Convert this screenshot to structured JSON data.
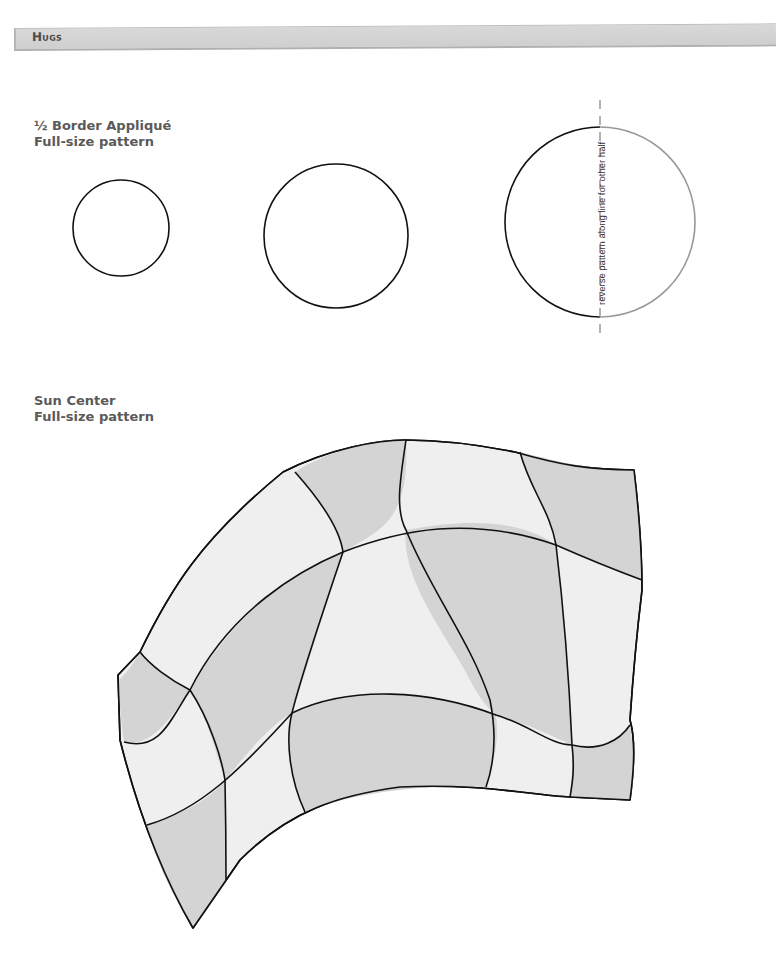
{
  "header": {
    "title": "Hugs"
  },
  "border_applique": {
    "title_line1": "½ Border Appliqué",
    "title_line2": "Full-size pattern",
    "circles": [
      {
        "cx": 121,
        "cy": 228,
        "r": 48
      },
      {
        "cx": 336,
        "cy": 236,
        "r": 72
      },
      {
        "cx": 600,
        "cy": 222,
        "r": 95
      }
    ],
    "reverse_note": "reverse pattern along line for other half"
  },
  "sun_center": {
    "title_line1": "Sun Center",
    "title_line2": "Full-size pattern"
  },
  "colors": {
    "light_fill": "#efefef",
    "dark_fill": "#d4d4d4",
    "outline": "#111111",
    "guide": "#999999",
    "header_bg": "#d4d4d4"
  }
}
